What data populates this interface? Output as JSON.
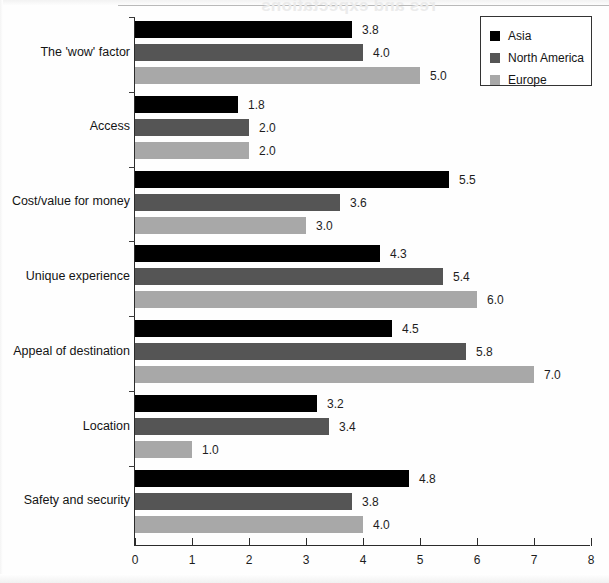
{
  "scan": {
    "bleed_title": "res and expectations"
  },
  "legend": {
    "position": "top-right",
    "entries": [
      {
        "label": "Asia",
        "color": "#000000"
      },
      {
        "label": "North America",
        "color": "#555555"
      },
      {
        "label": "Europe",
        "color": "#a8a8a8"
      }
    ]
  },
  "axis": {
    "x_ticks": [
      "0",
      "1",
      "2",
      "3",
      "4",
      "5",
      "6",
      "7",
      "8"
    ]
  },
  "chart_data": {
    "type": "bar",
    "orientation": "horizontal",
    "title": "",
    "xlabel": "",
    "ylabel": "",
    "xlim": [
      0,
      8
    ],
    "grid": false,
    "legend_position": "top-right",
    "categories": [
      "The 'wow' factor",
      "Access",
      "Cost/value for money",
      "Unique experience",
      "Appeal of destination",
      "Location",
      "Safety and security"
    ],
    "series": [
      {
        "name": "Asia",
        "color": "#000000",
        "values": [
          3.8,
          1.8,
          5.5,
          4.3,
          4.5,
          3.2,
          4.8
        ]
      },
      {
        "name": "North America",
        "color": "#555555",
        "values": [
          4.0,
          2.0,
          3.6,
          5.4,
          5.8,
          3.4,
          3.8
        ]
      },
      {
        "name": "Europe",
        "color": "#a8a8a8",
        "values": [
          5.0,
          2.0,
          3.0,
          6.0,
          7.0,
          1.0,
          4.0
        ]
      }
    ],
    "value_labels": [
      [
        "3.8",
        "4.0",
        "5.0"
      ],
      [
        "1.8",
        "2.0",
        "2.0"
      ],
      [
        "5.5",
        "3.6",
        "3.0"
      ],
      [
        "4.3",
        "5.4",
        "6.0"
      ],
      [
        "4.5",
        "5.8",
        "7.0"
      ],
      [
        "3.2",
        "3.4",
        "1.0"
      ],
      [
        "4.8",
        "3.8",
        "4.0"
      ]
    ]
  }
}
